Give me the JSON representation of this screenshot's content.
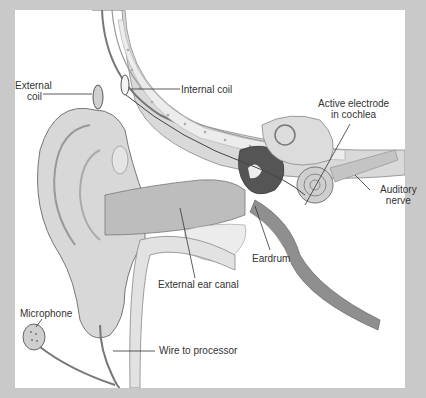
{
  "diagram": {
    "colors": {
      "frame": "#c9c9c9",
      "panel": "#ffffff",
      "tissue": "#d6d6d6",
      "tissue_dark": "#9a9a9a",
      "bone": "#e8e8e8",
      "leader_line": "#333333"
    },
    "labels": [
      {
        "id": "external-coil",
        "lines": [
          "External",
          "coil"
        ]
      },
      {
        "id": "internal-coil",
        "lines": [
          "Internal coil"
        ]
      },
      {
        "id": "active-electrode",
        "lines": [
          "Active electrode",
          "in cochlea"
        ]
      },
      {
        "id": "auditory-nerve",
        "lines": [
          "Auditory",
          "nerve"
        ]
      },
      {
        "id": "eardrum",
        "lines": [
          "Eardrum"
        ]
      },
      {
        "id": "external-ear-canal",
        "lines": [
          "External ear canal"
        ]
      },
      {
        "id": "microphone",
        "lines": [
          "Microphone"
        ]
      },
      {
        "id": "wire-to-processor",
        "lines": [
          "Wire to processor"
        ]
      }
    ]
  }
}
